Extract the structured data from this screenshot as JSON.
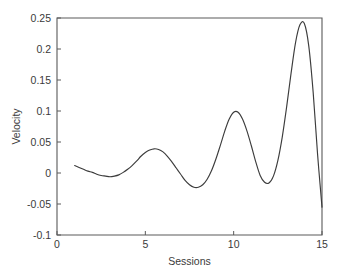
{
  "chart_data": {
    "type": "line",
    "title": "",
    "xlabel": "Sessions",
    "ylabel": "Velocity",
    "xlim": [
      0,
      15
    ],
    "ylim": [
      -0.1,
      0.25
    ],
    "xticks": [
      0,
      5,
      10,
      15
    ],
    "yticks": [
      -0.1,
      -0.05,
      0,
      0.05,
      0.1,
      0.15,
      0.2,
      0.25
    ],
    "xtick_labels": [
      "0",
      "5",
      "10",
      "15"
    ],
    "ytick_labels": [
      "-0.1",
      "-0.05",
      "0",
      "0.05",
      "0.1",
      "0.15",
      "0.2",
      "0.25"
    ],
    "grid": false,
    "legend": null,
    "line_color": "#3c3c3c",
    "axis_color": "#5a5a5a",
    "background_color": "#ffffff",
    "series": [
      {
        "name": "Velocity",
        "x": [
          1.0,
          1.25,
          1.5,
          1.75,
          2.0,
          2.25,
          2.5,
          2.75,
          3.0,
          3.25,
          3.5,
          3.75,
          4.0,
          4.25,
          4.5,
          4.75,
          5.0,
          5.25,
          5.5,
          5.75,
          6.0,
          6.25,
          6.5,
          6.75,
          7.0,
          7.25,
          7.5,
          7.75,
          8.0,
          8.25,
          8.5,
          8.75,
          9.0,
          9.25,
          9.5,
          9.75,
          10.0,
          10.25,
          10.5,
          10.75,
          11.0,
          11.25,
          11.5,
          11.75,
          12.0,
          12.25,
          12.5,
          12.75,
          13.0,
          13.25,
          13.5,
          13.75,
          14.0,
          14.25,
          14.5,
          14.75,
          15.0
        ],
        "y": [
          0.012,
          0.009,
          0.006,
          0.003,
          0.001,
          -0.002,
          -0.004,
          -0.005,
          -0.006,
          -0.005,
          -0.003,
          0.001,
          0.006,
          0.012,
          0.019,
          0.027,
          0.033,
          0.037,
          0.039,
          0.038,
          0.034,
          0.027,
          0.018,
          0.008,
          -0.002,
          -0.012,
          -0.019,
          -0.023,
          -0.023,
          -0.019,
          -0.01,
          0.004,
          0.023,
          0.045,
          0.068,
          0.087,
          0.098,
          0.098,
          0.087,
          0.068,
          0.044,
          0.018,
          -0.004,
          -0.015,
          -0.016,
          -0.005,
          0.02,
          0.058,
          0.107,
          0.161,
          0.21,
          0.239,
          0.241,
          0.205,
          0.13,
          0.03,
          -0.055
        ]
      }
    ],
    "annotations": {
      "global_max": {
        "x": 13.8,
        "y": 0.242
      },
      "global_min_endpoint": {
        "x": 15.0,
        "y": -0.055
      },
      "local_peaks": [
        {
          "x": 5.5,
          "y": 0.039
        },
        {
          "x": 9.8,
          "y": 0.099
        },
        {
          "x": 13.8,
          "y": 0.242
        }
      ],
      "local_troughs": [
        {
          "x": 3.0,
          "y": -0.006
        },
        {
          "x": 7.8,
          "y": -0.023
        },
        {
          "x": 11.6,
          "y": -0.016
        }
      ]
    }
  }
}
